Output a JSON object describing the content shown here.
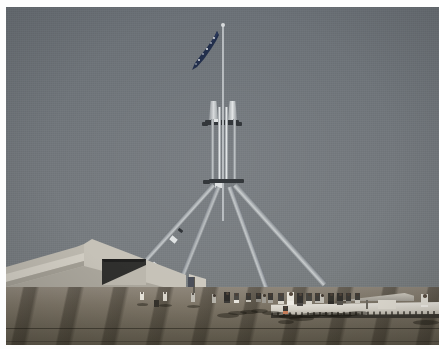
{
  "image": {
    "kind": "photograph",
    "subject": "Parliament House flagmast, Canberra",
    "orientation": "landscape",
    "border_color": "#fdfdfd",
    "alt_text": "A large four-legged stainless steel flagmast flying the Australian flag rises from the grassed roof terrace of Parliament House; visitors stand on the paved forecourt beneath, with a sloping pale concrete wall at left."
  },
  "scene": {
    "sky": {
      "label": "clear sky",
      "color_top": "#6a7076",
      "color_bottom": "#7b807f"
    },
    "flag": {
      "label": "Australian national flag",
      "color": "#1d2b4a",
      "star_color": "#e8eaec",
      "star_count": 6
    },
    "mast": {
      "label": "stainless steel flagmast",
      "color_light": "#e4e7e8",
      "color_mid": "#a9aeb2",
      "color_shadow": "#70757a",
      "leg_count": 4,
      "joint_color": "#2b2f33"
    },
    "building": {
      "label": "concrete curtain wall",
      "color": "#b9b5ab",
      "opening_color": "#2f2f2d"
    },
    "terrace": {
      "label": "paved forecourt with diagonal shadows",
      "color_near": "#5d5749",
      "color_far": "#8e867a",
      "shadow_color": "#1e1a12"
    },
    "railing": {
      "label": "white parapet balustrade",
      "color": "#e9e6df"
    },
    "people": {
      "label": "visitors on the terrace",
      "count": 24
    }
  }
}
